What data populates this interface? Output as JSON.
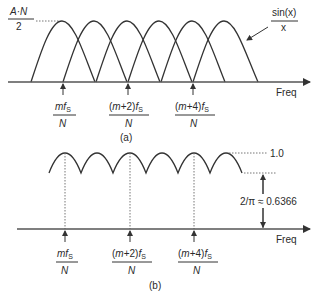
{
  "panel_a": {
    "caption": "(a)",
    "peak_label_num": "A·N",
    "peak_label_den": "2",
    "curve_label_num": "sin(x)",
    "curve_label_den": "x",
    "axis_label": "Freq",
    "ticks": [
      {
        "num_italic": "m",
        "num_plain": "",
        "num_f": "f",
        "sub": "S",
        "den": "N"
      },
      {
        "num_italic": "m",
        "num_plain": "+2)",
        "num_f": "f",
        "sub": "S",
        "den": "N"
      },
      {
        "num_italic": "m",
        "num_plain": "+4)",
        "num_f": "f",
        "sub": "S",
        "den": "N"
      }
    ]
  },
  "panel_b": {
    "caption": "(b)",
    "max_label": "1.0",
    "min_label": "2/π ≈ 0.6366",
    "axis_label": "Freq",
    "ticks": [
      {
        "num_italic": "m",
        "num_plain": "",
        "num_f": "f",
        "sub": "S",
        "den": "N"
      },
      {
        "num_italic": "m",
        "num_plain": "+2)",
        "num_f": "f",
        "sub": "S",
        "den": "N"
      },
      {
        "num_italic": "m",
        "num_plain": "+4)",
        "num_f": "f",
        "sub": "S",
        "den": "N"
      }
    ]
  },
  "colors": {
    "ink": "#333333",
    "background": "#ffffff"
  }
}
